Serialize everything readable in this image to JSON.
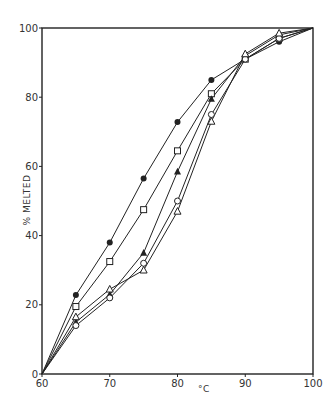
{
  "chart_data": {
    "type": "line",
    "title": "",
    "xlabel": "°C",
    "ylabel": "% MELTED",
    "xlim": [
      60,
      100
    ],
    "ylim": [
      0,
      100
    ],
    "grid": false,
    "legend": "none",
    "x_ticks": [
      60,
      70,
      80,
      90,
      100
    ],
    "y_ticks": [
      0,
      20,
      40,
      60,
      80,
      100
    ],
    "x": [
      60,
      65,
      70,
      75,
      80,
      85,
      90,
      95,
      100
    ],
    "series": [
      {
        "name": "filled circle",
        "marker": "filled-circle",
        "values": [
          0,
          22.8,
          38,
          56.5,
          72.8,
          85,
          91,
          96,
          100
        ]
      },
      {
        "name": "open square",
        "marker": "open-square",
        "values": [
          0,
          19.5,
          32.5,
          47.5,
          64.5,
          81,
          91,
          97,
          100
        ]
      },
      {
        "name": "filled triangle",
        "marker": "filled-triangle",
        "values": [
          0,
          15,
          23,
          35,
          58.5,
          79.5,
          92,
          98,
          100
        ]
      },
      {
        "name": "open circle",
        "marker": "open-circle",
        "values": [
          0,
          14,
          22,
          32,
          50,
          75,
          91,
          97,
          100
        ]
      },
      {
        "name": "open triangle",
        "marker": "open-triangle",
        "values": [
          0,
          16.5,
          24.5,
          30,
          47,
          73,
          92.5,
          98.5,
          100
        ]
      }
    ]
  },
  "axes": {
    "x_tick_labels": [
      "60",
      "70",
      "80",
      "90",
      "100"
    ],
    "y_tick_labels": [
      "0",
      "20",
      "40",
      "60",
      "80",
      "100"
    ],
    "xlabel": "°C",
    "ylabel": "% MELTED"
  }
}
